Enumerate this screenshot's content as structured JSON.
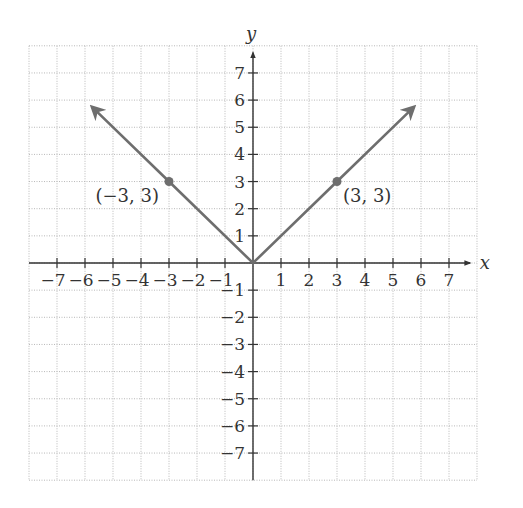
{
  "chart_data": {
    "type": "line",
    "title": "",
    "function": "y = |x|",
    "xlabel": "x",
    "ylabel": "y",
    "xlim": [
      -8,
      8
    ],
    "ylim": [
      -8,
      8
    ],
    "grid": true,
    "x_ticks": [
      -7,
      -6,
      -5,
      -4,
      -3,
      -2,
      -1,
      1,
      2,
      3,
      4,
      5,
      6,
      7
    ],
    "y_ticks": [
      -7,
      -6,
      -5,
      -4,
      -3,
      -2,
      -1,
      1,
      2,
      3,
      4,
      5,
      6,
      7
    ],
    "x_tick_labels": [
      "−7",
      "−6",
      "−5",
      "−4",
      "−3",
      "−2",
      "−1",
      "1",
      "2",
      "3",
      "4",
      "5",
      "6",
      "7"
    ],
    "y_tick_labels": [
      "−7",
      "−6",
      "−5",
      "−4",
      "−3",
      "−2",
      "−1",
      "1",
      "2",
      "3",
      "4",
      "5",
      "6",
      "7"
    ],
    "series": [
      {
        "name": "y = |x|",
        "x": [
          -5.75,
          -3,
          0,
          3,
          5.75
        ],
        "y": [
          5.75,
          3,
          0,
          3,
          5.75
        ],
        "color": "#6e6e6e",
        "arrows_at_ends": true
      }
    ],
    "points": [
      {
        "x": -3,
        "y": 3,
        "label": "(−3,  3)"
      },
      {
        "x": 3,
        "y": 3,
        "label": "(3,  3)"
      }
    ]
  },
  "colors": {
    "graph": "#6e6e6e",
    "axis": "#333333",
    "grid": "#b8b8b8"
  }
}
